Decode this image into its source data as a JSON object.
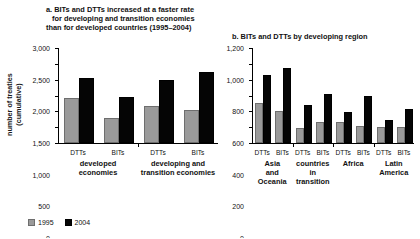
{
  "legend": {
    "position": "bottom-left",
    "entries": [
      {
        "label": "1995",
        "color": "#9a9a9a"
      },
      {
        "label": "2004",
        "color": "#050505"
      }
    ]
  },
  "axis": {
    "ylabel_line1": "number of treaties",
    "ylabel_line2": "(cumulative)"
  },
  "chart_data": [
    {
      "type": "bar",
      "panel": "a",
      "title_line1": "a. BITs and DTTs increased at a faster rate",
      "title_line2": "for developing and transition economies",
      "title_line3": "than for developed countries (1995–2004)",
      "title": "a. BITs and DTTs increased at a faster rate for developing and transition economies than for developed countries (1995–2004)",
      "xlabel": "",
      "ylabel": "number of treaties (cumulative)",
      "ylim": [
        0,
        3000
      ],
      "yticks": [
        0,
        500,
        1000,
        1500,
        2000,
        2500,
        3000
      ],
      "ytick_labels": [
        "0",
        "500",
        "1,000",
        "1,500",
        "2,000",
        "2,500",
        "3,000"
      ],
      "grid": false,
      "categories": [
        "DTTs",
        "BITs",
        "DTTs",
        "BITs"
      ],
      "group_labels": [
        {
          "line1": "developed",
          "line2": "economies",
          "spans": [
            0,
            1
          ]
        },
        {
          "line1": "developing and",
          "line2": "transition economies",
          "spans": [
            2,
            3
          ]
        }
      ],
      "series": [
        {
          "name": "1995",
          "values": [
            1430,
            790,
            1160,
            1050
          ]
        },
        {
          "name": "2004",
          "values": [
            2040,
            1450,
            1980,
            2250
          ]
        }
      ]
    },
    {
      "type": "bar",
      "panel": "b",
      "title_line1": "b. BITs and DTTs by developing region",
      "title": "b. BITs and DTTs by developing region",
      "xlabel": "",
      "ylabel": "",
      "ylim": [
        0,
        1200
      ],
      "yticks": [
        0,
        200,
        400,
        600,
        800,
        1000,
        1200
      ],
      "ytick_labels": [
        "0",
        "200",
        "400",
        "600",
        "800",
        "1,000",
        "1,200"
      ],
      "grid": false,
      "categories": [
        "DTTs",
        "BITs",
        "DTTs",
        "BITs",
        "DTTs",
        "BITs",
        "DTTs",
        "BITs"
      ],
      "group_labels": [
        {
          "line1": "Asia",
          "line2": "and",
          "line3": "Oceania",
          "spans": [
            0,
            1
          ]
        },
        {
          "line1": "countries",
          "line2": "in",
          "line3": "transition",
          "spans": [
            2,
            3
          ]
        },
        {
          "line1": "Africa",
          "line2": "",
          "line3": "",
          "spans": [
            4,
            5
          ]
        },
        {
          "line1": "Latin",
          "line2": "America",
          "line3": "",
          "spans": [
            6,
            7
          ]
        }
      ],
      "series": [
        {
          "name": "1995",
          "values": [
            510,
            400,
            185,
            270,
            265,
            210,
            200,
            205
          ]
        },
        {
          "name": "2004",
          "values": [
            865,
            950,
            480,
            625,
            395,
            595,
            285,
            435
          ]
        }
      ]
    }
  ]
}
